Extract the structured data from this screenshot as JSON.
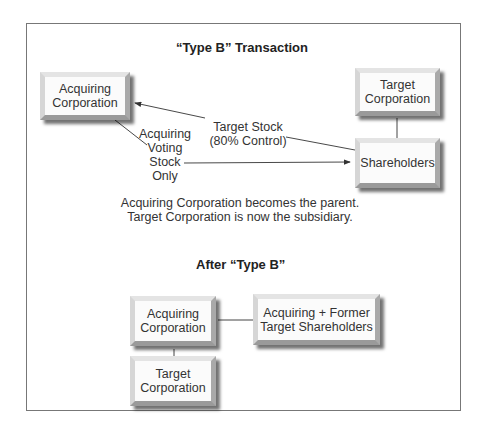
{
  "top_diagram": {
    "title": "“Type B” Transaction",
    "acquiring": {
      "line1": "Acquiring",
      "line2": "Corporation"
    },
    "target": {
      "line1": "Target",
      "line2": "Corporation"
    },
    "shareholders": {
      "line1": "Shareholders"
    },
    "arrow_target_stock": {
      "line1": "Target Stock",
      "line2": "(80% Control)"
    },
    "arrow_acquiring_stock": {
      "line1": "Acquiring",
      "line2": "Voting",
      "line3": "Stock",
      "line4": "Only"
    },
    "caption": {
      "line1": "Acquiring Corporation becomes the parent.",
      "line2": "Target Corporation is now the subsidiary."
    }
  },
  "bottom_diagram": {
    "title": "After “Type B”",
    "acquiring": {
      "line1": "Acquiring",
      "line2": "Corporation"
    },
    "shareholders": {
      "line1": "Acquiring + Former",
      "line2": "Target Shareholders"
    },
    "target": {
      "line1": "Target",
      "line2": "Corporation"
    }
  }
}
